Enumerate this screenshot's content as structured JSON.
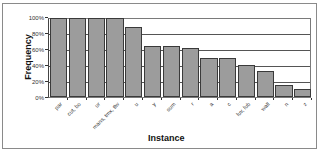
{
  "chart_data": {
    "type": "bar",
    "title": "",
    "xlabel": "Instance",
    "ylabel": "Frequency",
    "ylim": [
      0,
      100
    ],
    "y_format": "percent",
    "yticks": [
      "0%",
      "20%",
      "40%",
      "60%",
      "80%",
      "100%"
    ],
    "grid": true,
    "legend": "none",
    "categories": [
      "par",
      "cut, bo",
      "ur",
      "mans, tmx, tlw",
      "u",
      "y",
      "sum",
      "r",
      "a",
      "c",
      "luv, lub",
      "wall",
      "n",
      "z"
    ],
    "values": [
      100,
      100,
      100,
      100,
      88,
      65,
      65,
      62,
      50,
      50,
      40,
      33,
      15,
      10
    ],
    "bar_color": "#9c9c9c"
  },
  "axis": {
    "ylabel": "Frequency",
    "xlabel": "Instance",
    "yticks": [
      "0%",
      "20%",
      "40%",
      "60%",
      "80%",
      "100%"
    ]
  }
}
